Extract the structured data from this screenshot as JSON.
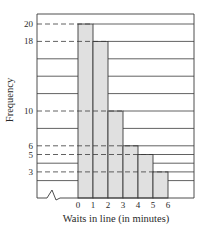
{
  "chart_data": {
    "type": "bar",
    "subtype": "histogram",
    "title": "",
    "xlabel": "Waits in line (in minutes)",
    "ylabel": "Frequency",
    "categories": [
      "0-1",
      "1-2",
      "2-3",
      "3-4",
      "4-5",
      "5-6"
    ],
    "bin_edges": [
      0,
      1,
      2,
      3,
      4,
      5,
      6
    ],
    "values": [
      20,
      18,
      10,
      6,
      5,
      3
    ],
    "x_tick_labels": [
      "0",
      "1",
      "2",
      "3",
      "4",
      "5",
      "6"
    ],
    "y_tick_labels": [
      "20",
      "18",
      "10",
      "6",
      "5",
      "3"
    ],
    "ylim": [
      0,
      22
    ],
    "grid": "horizontal lines every 2 units",
    "reference_lines": "dashed lines from y-axis at each bar height",
    "axis_break": "zigzag on x-axis before 0",
    "bar_color": "#e0e0e0",
    "line_color": "#3a3a3a"
  }
}
